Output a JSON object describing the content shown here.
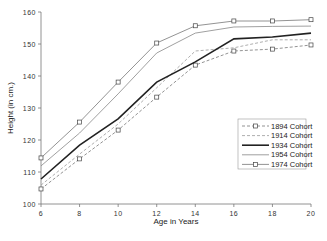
{
  "chart_data": {
    "type": "line",
    "title": "",
    "xlabel": "Age in Years",
    "ylabel": "Height (in cm.)",
    "x": [
      6,
      8,
      10,
      12,
      14,
      16,
      18,
      20
    ],
    "xlim": [
      6,
      20
    ],
    "ylim": [
      100,
      160
    ],
    "xticks": [
      "6",
      "8",
      "10",
      "12",
      "14",
      "16",
      "18",
      "20"
    ],
    "yticks": [
      "100",
      "110",
      "120",
      "130",
      "140",
      "150",
      "160"
    ],
    "grid": false,
    "legend_position": "lower right",
    "series": [
      {
        "name": "1894 Cohort",
        "style": "dashed-thin-square-markers",
        "color": "#777777",
        "values": [
          104.7,
          114.1,
          123.1,
          133.4,
          143.4,
          147.8,
          148.4,
          149.7
        ]
      },
      {
        "name": "1914 Cohort",
        "style": "dashed",
        "color": "#999999",
        "values": [
          105.9,
          115.6,
          125.0,
          136.3,
          147.8,
          148.8,
          151.3,
          151.3
        ]
      },
      {
        "name": "1934 Cohort",
        "style": "solid-thick",
        "color": "#222222",
        "values": [
          107.8,
          118.4,
          126.6,
          138.1,
          144.4,
          151.6,
          152.2,
          153.4
        ]
      },
      {
        "name": "1954 Cohort",
        "style": "solid-thin",
        "color": "#888888",
        "values": [
          111.9,
          122.2,
          134.4,
          147.2,
          153.4,
          155.3,
          155.5,
          155.6
        ]
      },
      {
        "name": "1974 Cohort",
        "style": "solid-thin-square-markers",
        "color": "#777777",
        "values": [
          114.4,
          125.6,
          138.1,
          150.3,
          155.7,
          157.2,
          157.2,
          157.6
        ]
      }
    ]
  },
  "legend": {
    "items": [
      "1894 Cohort",
      "1914 Cohort",
      "1934 Cohort",
      "1954 Cohort",
      "1974 Cohort"
    ]
  }
}
